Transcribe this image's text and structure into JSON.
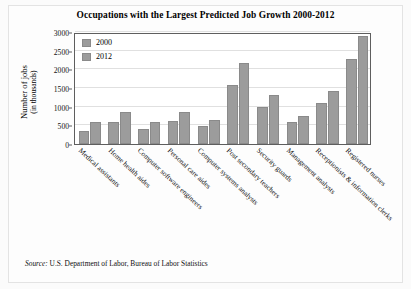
{
  "chart_data": {
    "type": "bar",
    "title": "Occupations with the Largest Predicted Job Growth 2000-2012",
    "xlabel": "",
    "ylabel": "Number of jobs",
    "ylabel_line2": "(in thousands)",
    "ylim": [
      0,
      3000
    ],
    "yticks": [
      0,
      500,
      1000,
      1500,
      2000,
      2500,
      3000
    ],
    "grid": true,
    "legend_position": "top-left",
    "categories": [
      "Medical assistants",
      "Home health aides",
      "Computer software engineers",
      "Personal care aides",
      "Computer systems analysts",
      "Post secondary teachers",
      "Security guards",
      "Management analysts",
      "Receptionists & information clerks",
      "Registered nurses"
    ],
    "series": [
      {
        "name": "2000",
        "color": "#9c9c9c",
        "values": [
          360,
          580,
          400,
          610,
          480,
          1570,
          1000,
          590,
          1090,
          2290
        ]
      },
      {
        "name": "2012",
        "color": "#9c9c9c",
        "values": [
          580,
          860,
          580,
          860,
          650,
          2180,
          1310,
          760,
          1420,
          2900
        ]
      }
    ]
  },
  "source": {
    "label": "Source:",
    "text": " U.S. Department of Labor, Bureau of Labor Statistics"
  }
}
